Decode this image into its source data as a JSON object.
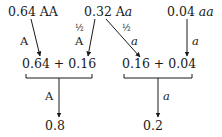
{
  "sources": [
    {
      "freq": "0.64",
      "genotype": "AA",
      "genotype_style": "upright"
    },
    {
      "freq": "0.32",
      "genotype_prefix": "A",
      "genotype_suffix": "a"
    },
    {
      "freq": "0.04",
      "genotype": "aa",
      "genotype_style": "italic"
    }
  ],
  "edge_labels": {
    "aa_to_A": "A",
    "Aa_to_A_fraction": "½",
    "Aa_to_A_allele": "A",
    "Aa_to_a_fraction": "½",
    "Aa_to_a_allele": "a",
    "aa_to_a": "a"
  },
  "sums": {
    "A_sum": "0.64 + 0.16",
    "a_sum": "0.16 + 0.04"
  },
  "results": {
    "A_label": "A",
    "A_value": "0.8",
    "a_label": "a",
    "a_value": "0.2"
  },
  "colors": {
    "ink": "#1a1a1a",
    "background": "#ffffff"
  }
}
